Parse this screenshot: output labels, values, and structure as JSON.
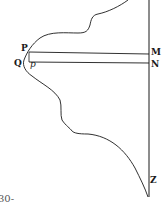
{
  "diagram": {
    "stroke_color": "#1a1a1a",
    "labels": {
      "P": "P",
      "Q": "Q",
      "p": "p",
      "M": "M",
      "N": "N",
      "Z": "Z"
    },
    "fragment_text": "30-"
  }
}
